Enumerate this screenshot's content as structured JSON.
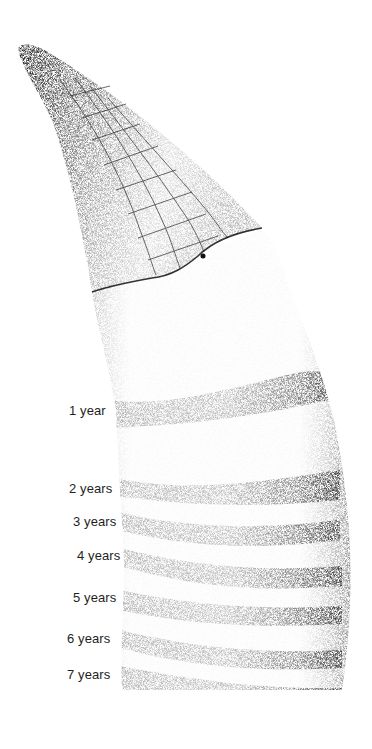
{
  "figure": {
    "labels": [
      {
        "text": "1 year",
        "x": 69,
        "y": 404
      },
      {
        "text": "2 years",
        "x": 69,
        "y": 482
      },
      {
        "text": "3 years",
        "x": 73,
        "y": 515
      },
      {
        "text": "4 years",
        "x": 77,
        "y": 549
      },
      {
        "text": "5 years",
        "x": 73,
        "y": 591
      },
      {
        "text": "6 years",
        "x": 67,
        "y": 632
      },
      {
        "text": "7 years",
        "x": 67,
        "y": 668
      }
    ],
    "colors": {
      "ink": "#1e1e1e",
      "paper": "#ffffff",
      "stipple": "#6b6b6b"
    }
  }
}
